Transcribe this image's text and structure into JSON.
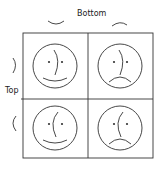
{
  "diagram": {
    "axis_labels": {
      "top_axis": "Bottom",
      "left_axis": "Top"
    },
    "column_headers": [
      {
        "glyph": "smile-arc",
        "meaning": "smile"
      },
      {
        "glyph": "frown-arc",
        "meaning": "frown"
      }
    ],
    "row_headers": [
      {
        "glyph": ")",
        "meaning": "nose-right"
      },
      {
        "glyph": "(",
        "meaning": "nose-left"
      }
    ],
    "cells": [
      {
        "row": 0,
        "col": 0,
        "mouth": "smile",
        "nose": "right"
      },
      {
        "row": 0,
        "col": 1,
        "mouth": "frown",
        "nose": "right"
      },
      {
        "row": 1,
        "col": 0,
        "mouth": "smile",
        "nose": "left"
      },
      {
        "row": 1,
        "col": 1,
        "mouth": "frown",
        "nose": "left"
      }
    ],
    "colors": {
      "stroke": "#333333",
      "background": "#ffffff"
    }
  }
}
